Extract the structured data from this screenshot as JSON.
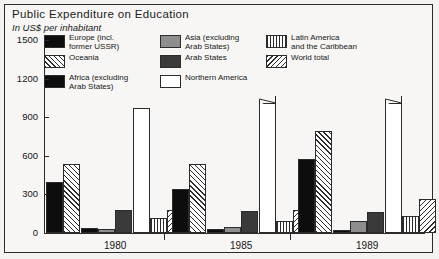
{
  "title": "Public Expenditure on Education",
  "subtitle": "In US$ per inhabitant",
  "legend": {
    "col1": [
      {
        "key": "europe",
        "label": "Europe (incl.\nformer USSR)",
        "color": "#0d0d0d"
      },
      {
        "key": "oceania",
        "label": "Oceania",
        "color": "#ffffff"
      },
      {
        "key": "africa",
        "label": "Africa (excluding\nArab States)",
        "color": "#0d0d0d"
      }
    ],
    "col2": [
      {
        "key": "asia",
        "label": "Asia (excluding\nArab States)",
        "color": "#8e8e8e"
      },
      {
        "key": "arab",
        "label": "Arab States",
        "color": "#3a3a3a"
      },
      {
        "key": "north",
        "label": "Northern America",
        "color": "#ffffff"
      }
    ],
    "col3": [
      {
        "key": "latin",
        "label": "Latin America\nand the Caribbean",
        "color": "#ffffff"
      },
      {
        "key": "world",
        "label": "World total",
        "color": "#ffffff"
      }
    ]
  },
  "axis": {
    "y_ticks": [
      "1500",
      "1200",
      "900",
      "600",
      "300",
      "0"
    ],
    "x_labels": [
      "1980",
      "1985",
      "1989"
    ]
  },
  "chart_data": {
    "type": "bar",
    "title": "Public Expenditure on Education",
    "subtitle": "In US$ per inhabitant",
    "xlabel": "",
    "ylabel": "US$ per inhabitant",
    "ylim": [
      0,
      1500
    ],
    "yticks": [
      0,
      300,
      600,
      900,
      1200,
      1500
    ],
    "grid": false,
    "legend_position": "top",
    "note": "Northern America bars for 1985 and 1989 are clipped with a broken-axis zigzag above 1200",
    "categories": [
      "1980",
      "1985",
      "1989"
    ],
    "series": [
      {
        "name": "Europe (incl. former USSR)",
        "color": "#0d0d0d",
        "pattern": "solid-black",
        "values": [
          400,
          345,
          575
        ]
      },
      {
        "name": "Oceania",
        "color": "#ffffff",
        "pattern": "diagonal-hatch-45",
        "values": [
          540,
          540,
          790
        ]
      },
      {
        "name": "Africa (excluding Arab States)",
        "color": "#0d0d0d",
        "pattern": "solid-black",
        "values": [
          40,
          30,
          25
        ]
      },
      {
        "name": "Asia (excluding Arab States)",
        "color": "#8e8e8e",
        "pattern": "solid-grey",
        "values": [
          30,
          50,
          95
        ]
      },
      {
        "name": "Arab States",
        "color": "#3a3a3a",
        "pattern": "solid-dark-grey",
        "values": [
          180,
          170,
          160
        ]
      },
      {
        "name": "Northern America",
        "color": "#ffffff",
        "pattern": "open-white",
        "values": [
          970,
          1285,
          1440
        ],
        "clipped": [
          false,
          true,
          true
        ]
      },
      {
        "name": "Latin America and the Caribbean",
        "color": "#ffffff",
        "pattern": "vertical-hatch",
        "values": [
          120,
          90,
          130
        ]
      },
      {
        "name": "World total",
        "color": "#ffffff",
        "pattern": "diagonal-hatch-135",
        "values": [
          180,
          180,
          265
        ]
      }
    ]
  }
}
